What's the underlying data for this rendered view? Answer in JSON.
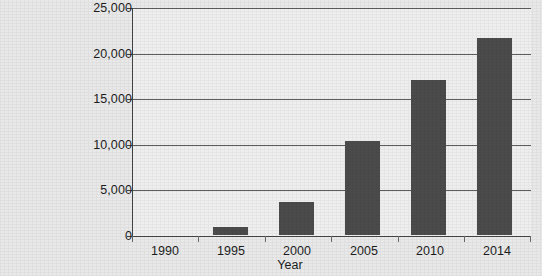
{
  "chart_data": {
    "type": "bar",
    "title": "",
    "subtitle": "",
    "xlabel": "Year",
    "ylabel": "",
    "categories": [
      "1990",
      "1995",
      "2000",
      "2005",
      "2010",
      "2014"
    ],
    "values": [
      0,
      900,
      3600,
      10400,
      17100,
      21700
    ],
    "ylim": [
      0,
      25000
    ],
    "ytick_labels": [
      "25,000",
      "20,000",
      "15,000",
      "10,000",
      "5,000",
      "0"
    ],
    "ytick_values": [
      25000,
      20000,
      15000,
      10000,
      5000,
      0
    ],
    "grid": true,
    "grid_axis": "y",
    "legend": false,
    "legend_position": "none",
    "series": [
      {
        "name": "",
        "values": [
          0,
          900,
          3600,
          10400,
          17100,
          21700
        ]
      }
    ],
    "colors": {
      "bar": "#4b4b4b",
      "plot_background": "#efefef",
      "page_background": "#e9e9e9",
      "axis": "#454545",
      "gridline": "#5d5d5d",
      "text": "#1d1d1d"
    }
  }
}
